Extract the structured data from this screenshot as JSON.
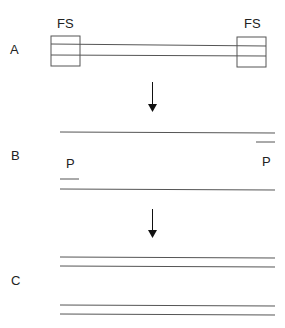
{
  "panels": {
    "a": {
      "label": "A",
      "left_box_label": "FS",
      "right_box_label": "FS"
    },
    "b": {
      "label": "B",
      "left_primer_label": "P",
      "right_primer_label": "P"
    },
    "c": {
      "label": "C"
    }
  },
  "colors": {
    "line": "#555555",
    "text": "#222222",
    "arrow": "#111111"
  }
}
